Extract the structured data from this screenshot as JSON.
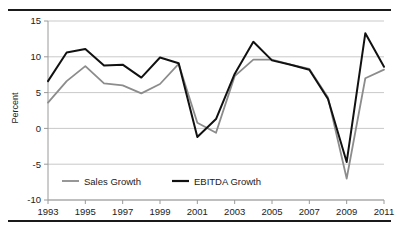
{
  "chart_data": {
    "type": "line",
    "title": "",
    "xlabel": "",
    "ylabel": "Percent",
    "xlim": [
      1993,
      2011
    ],
    "ylim": [
      -10,
      15
    ],
    "yticks": [
      -10,
      -5,
      0,
      5,
      10,
      15
    ],
    "ytick_labels": [
      "-10",
      "-5",
      "0",
      "5",
      "10",
      "15"
    ],
    "xticks": [
      1993,
      1995,
      1997,
      1999,
      2001,
      2003,
      2005,
      2007,
      2009,
      2011
    ],
    "xtick_labels": [
      "1993",
      "1995",
      "1997",
      "1999",
      "2001",
      "2003",
      "2005",
      "2007",
      "2009",
      "2011"
    ],
    "x": [
      1993,
      1994,
      1995,
      1996,
      1997,
      1998,
      1999,
      2000,
      2001,
      2002,
      2003,
      2004,
      2005,
      2006,
      2007,
      2008,
      2009,
      2010,
      2011
    ],
    "grid": "horizontal",
    "legend_position": "inside-bottom-left",
    "series": [
      {
        "name": "Sales Growth",
        "color": "#8c8c8c",
        "width": 1.8,
        "values": [
          3.6,
          6.6,
          8.7,
          6.3,
          6.0,
          4.9,
          6.2,
          9.0,
          0.8,
          -0.6,
          7.3,
          9.6,
          9.6,
          8.9,
          8.3,
          4.3,
          -7.0,
          7.0,
          8.2
        ]
      },
      {
        "name": "EBITDA Growth",
        "color": "#111111",
        "width": 2.0,
        "values": [
          6.6,
          10.6,
          11.1,
          8.8,
          8.9,
          7.1,
          9.9,
          9.1,
          -1.2,
          1.3,
          7.6,
          12.1,
          9.5,
          8.9,
          8.2,
          4.1,
          -4.7,
          13.3,
          8.6
        ]
      }
    ]
  },
  "legend": {
    "items": [
      {
        "label": "Sales Growth",
        "color": "#8c8c8c"
      },
      {
        "label": "EBITDA Growth",
        "color": "#111111"
      }
    ]
  },
  "axes": {
    "y_title": "Percent"
  }
}
